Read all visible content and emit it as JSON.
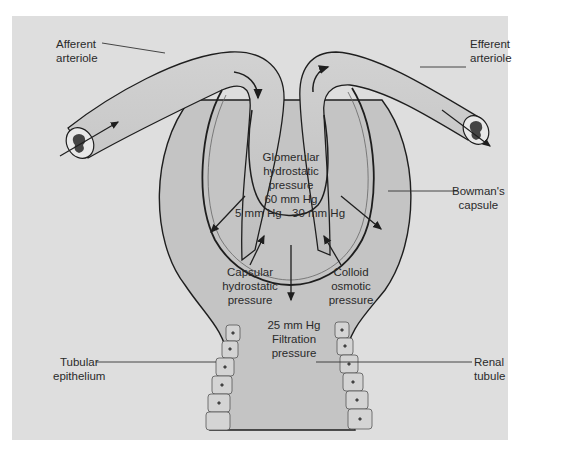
{
  "figure": {
    "colors": {
      "background": "#dedede",
      "vessel_fill": "#c9c9c9",
      "capsule_fill": "#c4c4c4",
      "outline": "#1e1e1e",
      "text": "#2a2a2a"
    }
  },
  "labels": {
    "afferent": [
      "Afferent",
      "arteriole"
    ],
    "efferent": [
      "Efferent",
      "arteriole"
    ],
    "bowmans": [
      "Bowman's",
      "capsule"
    ],
    "tubular_epithelium": [
      "Tubular",
      "epithelium"
    ],
    "renal_tubule": [
      "Renal",
      "tubule"
    ]
  },
  "pressures": {
    "glomerular": {
      "lines": [
        "Glomerular",
        "hydrostatic",
        "pressure"
      ],
      "value": "60 mm Hg"
    },
    "capsular_value": "5 mm Hg",
    "colloid_value": "30 mm Hg",
    "capsular": [
      "Capsular",
      "hydrostatic",
      "pressure"
    ],
    "colloid": [
      "Colloid",
      "osmotic",
      "pressure"
    ],
    "filtration": {
      "value": "25 mm Hg",
      "lines": [
        "Filtration",
        "pressure"
      ]
    }
  }
}
